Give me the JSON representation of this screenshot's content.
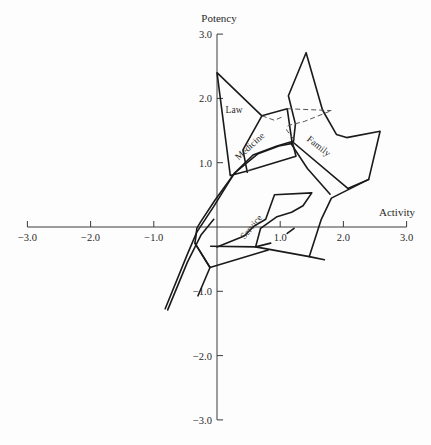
{
  "chart_data": {
    "type": "line",
    "title": "",
    "xlabel": "Activity",
    "ylabel": "Potency",
    "xlim": [
      -3.0,
      3.0
    ],
    "ylim": [
      -3.0,
      3.0
    ],
    "grid": false,
    "legend": null,
    "x_ticks": [
      "-3.0",
      "-2.0",
      "-1.0",
      "1.0",
      "2.0",
      "3.0"
    ],
    "y_ticks": [
      "3.0",
      "2.0",
      "1.0",
      "-1.0",
      "-2.0",
      "-3.0"
    ],
    "x_tick_values": [
      -3,
      -2,
      -1,
      1,
      2,
      3
    ],
    "y_tick_values": [
      3,
      2,
      1,
      -1,
      -2,
      -3
    ],
    "region_labels": [
      {
        "text": "Law",
        "x": 0.27,
        "y": 1.78,
        "rotate": 0
      },
      {
        "text": "Medicine",
        "x": 0.55,
        "y": 1.22,
        "rotate": -42
      },
      {
        "text": "Family",
        "x": 1.58,
        "y": 1.22,
        "rotate": 38
      },
      {
        "text": "Service",
        "x": 0.58,
        "y": -0.03,
        "rotate": -50
      }
    ],
    "series": [
      {
        "name": "Law outline",
        "style": "solid",
        "points": [
          [
            0.71,
            1.73
          ],
          [
            0.0,
            2.4
          ],
          [
            0.21,
            0.8
          ],
          [
            0.48,
            0.87
          ],
          [
            1.25,
            1.1
          ],
          [
            1.19,
            1.33
          ],
          [
            0.95,
            1.26
          ],
          [
            0.57,
            1.12
          ],
          [
            0.27,
            0.83
          ],
          [
            -0.05,
            0.32
          ],
          [
            -0.32,
            -0.08
          ],
          [
            -0.48,
            -0.45
          ],
          [
            -0.82,
            -1.27
          ]
        ]
      },
      {
        "name": "Medicine outline",
        "style": "solid",
        "points": [
          [
            0.48,
            0.85
          ],
          [
            0.41,
            1.2
          ],
          [
            0.71,
            1.73
          ],
          [
            1.11,
            1.84
          ],
          [
            1.19,
            1.3
          ],
          [
            0.98,
            1.26
          ],
          [
            0.65,
            1.14
          ],
          [
            0.28,
            0.84
          ],
          [
            -0.03,
            0.42
          ],
          [
            -0.26,
            0.08
          ],
          [
            -0.32,
            -0.02
          ],
          [
            -0.33,
            -0.13
          ],
          [
            -0.35,
            -0.25
          ],
          [
            -0.11,
            -0.63
          ],
          [
            0.81,
            -0.36
          ]
        ]
      },
      {
        "name": "Family outline",
        "style": "solid",
        "points": [
          [
            1.21,
            1.33
          ],
          [
            1.24,
            1.6
          ],
          [
            1.13,
            2.04
          ],
          [
            1.41,
            2.71
          ],
          [
            1.67,
            1.82
          ],
          [
            1.89,
            1.44
          ],
          [
            2.05,
            1.39
          ],
          [
            2.58,
            1.49
          ],
          [
            2.4,
            0.74
          ],
          [
            2.07,
            0.6
          ],
          [
            1.19,
            1.33
          ]
        ]
      },
      {
        "name": "Family lower",
        "style": "solid",
        "points": [
          [
            2.4,
            0.74
          ],
          [
            1.81,
            0.45
          ],
          [
            1.65,
            0.12
          ],
          [
            1.46,
            -0.46
          ],
          [
            1.7,
            -0.51
          ]
        ]
      },
      {
        "name": "Family inner",
        "style": "solid",
        "points": [
          [
            1.17,
            1.3
          ],
          [
            1.43,
            0.91
          ],
          [
            1.79,
            0.51
          ]
        ]
      },
      {
        "name": "Service outline",
        "style": "solid",
        "points": [
          [
            0.0,
            -0.31
          ],
          [
            0.43,
            -0.14
          ],
          [
            0.58,
            0.01
          ],
          [
            0.77,
            0.12
          ],
          [
            0.91,
            0.5
          ],
          [
            1.5,
            0.53
          ],
          [
            1.36,
            0.33
          ],
          [
            1.18,
            0.23
          ],
          [
            0.95,
            0.16
          ],
          [
            0.69,
            -0.02
          ],
          [
            0.61,
            -0.31
          ],
          [
            0.85,
            -0.25
          ]
        ]
      },
      {
        "name": "Service base",
        "style": "solid",
        "points": [
          [
            -0.1,
            -0.3
          ],
          [
            0.61,
            -0.31
          ],
          [
            1.46,
            -0.46
          ]
        ]
      },
      {
        "name": "Service tick",
        "style": "solid",
        "points": [
          [
            1.11,
            -0.1
          ],
          [
            1.22,
            -0.02
          ]
        ]
      },
      {
        "name": "Lower left branch",
        "style": "solid",
        "points": [
          [
            -0.35,
            -0.25
          ],
          [
            -0.11,
            -0.63
          ],
          [
            -0.3,
            -1.07
          ]
        ]
      },
      {
        "name": "Lower left long",
        "style": "solid",
        "points": [
          [
            -0.05,
            0.12
          ],
          [
            -0.25,
            -0.12
          ],
          [
            -0.47,
            -0.55
          ],
          [
            -0.78,
            -1.29
          ]
        ]
      },
      {
        "name": "Law dashed",
        "style": "dashed",
        "points": [
          [
            0.71,
            1.73
          ],
          [
            0.91,
            1.66
          ],
          [
            1.05,
            1.72
          ]
        ]
      },
      {
        "name": "Medicine dashed",
        "style": "dashed",
        "points": [
          [
            1.11,
            1.84
          ],
          [
            1.81,
            1.81
          ]
        ]
      },
      {
        "name": "Family dashed",
        "style": "dashed",
        "points": [
          [
            1.22,
            1.36
          ],
          [
            1.1,
            1.51
          ],
          [
            1.13,
            1.58
          ],
          [
            1.38,
            1.64
          ],
          [
            1.81,
            1.81
          ]
        ]
      },
      {
        "name": "Law-Medicine dashed",
        "style": "dashed",
        "points": [
          [
            0.48,
            0.87
          ],
          [
            0.6,
            0.92
          ]
        ]
      }
    ]
  },
  "axes": {
    "x_title": "Activity",
    "y_title": "Potency"
  }
}
